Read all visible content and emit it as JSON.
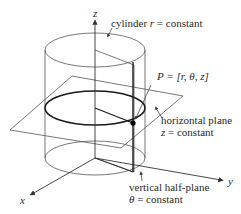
{
  "diagram": {
    "axes": {
      "z_label": "z",
      "x_label": "x",
      "y_label": "y"
    },
    "annotations": {
      "cylinder": {
        "prefix": "cylinder ",
        "var": "r",
        "suffix": " = constant"
      },
      "point": {
        "text": "P = [r, θ, z]"
      },
      "horizontal_plane": {
        "line1": "horizontal plane",
        "line2_var": "z",
        "line2_suffix": " = constant"
      },
      "vertical_half_plane": {
        "line1": "vertical half-plane",
        "line2_var": "θ",
        "line2_suffix": " = constant"
      }
    },
    "colors": {
      "line": "#4a4a4a",
      "thick_line": "#1a1a1a",
      "background": "#ffffff"
    }
  }
}
